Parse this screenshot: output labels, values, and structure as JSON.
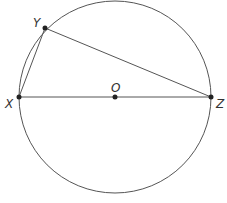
{
  "diagram": {
    "colors": {
      "stroke": "#555555",
      "point": "#222222",
      "label": "#333333",
      "background": "#ffffff"
    },
    "circle": {
      "center_label": "O",
      "cx": 115,
      "cy": 97,
      "r": 96
    },
    "points": [
      {
        "id": "X",
        "label": "X",
        "x": 19,
        "y": 97
      },
      {
        "id": "Y",
        "label": "Y",
        "x": 45,
        "y": 28
      },
      {
        "id": "O",
        "label": "O",
        "x": 115,
        "y": 97
      },
      {
        "id": "Z",
        "label": "Z",
        "x": 211,
        "y": 97
      }
    ],
    "segments": [
      {
        "from": "X",
        "to": "Y"
      },
      {
        "from": "Y",
        "to": "Z"
      },
      {
        "from": "X",
        "to": "Z"
      }
    ]
  }
}
